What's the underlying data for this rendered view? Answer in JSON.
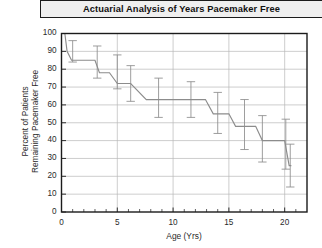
{
  "title": "Actuarial Analysis of Years Pacemaker Free",
  "axes": {
    "ylabel_line1": "Percent of Patients",
    "ylabel_line2": "Remaining Pacemaker Free",
    "xlabel": "Age (Yrs)"
  },
  "colors": {
    "curve": "#8c8c8c",
    "errorbar": "#8c8c8c",
    "grid": "#b8b8b8",
    "axis": "#1b1b1b",
    "title_fill": "#efefef",
    "plot_fill": "#ffffff"
  },
  "chart_data": {
    "type": "line",
    "title": "Actuarial Analysis of Years Pacemaker Free",
    "xlabel": "Age (Yrs)",
    "ylabel": "Percent of Patients Remaining Pacemaker Free",
    "xlim": [
      0,
      22
    ],
    "ylim": [
      0,
      100
    ],
    "xticks": [
      0,
      5,
      10,
      15,
      20
    ],
    "yticks": [
      0,
      10,
      20,
      30,
      40,
      50,
      60,
      70,
      80,
      90,
      100
    ],
    "xtick_labels": [
      "0",
      "5",
      "10",
      "15",
      "20"
    ],
    "ytick_labels": [
      "0",
      "10",
      "20",
      "30",
      "40",
      "50",
      "60",
      "70",
      "80",
      "90",
      "100"
    ],
    "grid": "horizontal-and-vertical",
    "legend": "none",
    "style": "kaplan-meier-step-survival",
    "series": [
      {
        "name": "Pacemaker-free survival",
        "step_points": [
          {
            "x": 0.0,
            "y": 100
          },
          {
            "x": 0.3,
            "y": 100
          },
          {
            "x": 0.5,
            "y": 90
          },
          {
            "x": 0.9,
            "y": 85
          },
          {
            "x": 1.0,
            "y": 85
          },
          {
            "x": 3.0,
            "y": 85
          },
          {
            "x": 3.4,
            "y": 78
          },
          {
            "x": 4.3,
            "y": 78
          },
          {
            "x": 5.0,
            "y": 72
          },
          {
            "x": 6.2,
            "y": 72
          },
          {
            "x": 7.6,
            "y": 63
          },
          {
            "x": 9.0,
            "y": 63
          },
          {
            "x": 12.9,
            "y": 63
          },
          {
            "x": 13.6,
            "y": 55
          },
          {
            "x": 15.0,
            "y": 55
          },
          {
            "x": 15.6,
            "y": 48
          },
          {
            "x": 17.4,
            "y": 48
          },
          {
            "x": 18.0,
            "y": 40
          },
          {
            "x": 20.0,
            "y": 40
          },
          {
            "x": 20.4,
            "y": 26
          },
          {
            "x": 20.6,
            "y": 26
          }
        ],
        "error_bars": [
          {
            "x": 1.0,
            "y": 90,
            "low": 84,
            "high": 96
          },
          {
            "x": 3.2,
            "y": 85,
            "low": 75,
            "high": 93
          },
          {
            "x": 5.0,
            "y": 78,
            "low": 69,
            "high": 88
          },
          {
            "x": 6.2,
            "y": 72,
            "low": 62,
            "high": 82
          },
          {
            "x": 8.7,
            "y": 63,
            "low": 53,
            "high": 75
          },
          {
            "x": 11.6,
            "y": 63,
            "low": 53,
            "high": 73
          },
          {
            "x": 14.0,
            "y": 55,
            "low": 44,
            "high": 67
          },
          {
            "x": 16.4,
            "y": 48,
            "low": 35,
            "high": 63
          },
          {
            "x": 18.0,
            "y": 40,
            "low": 28,
            "high": 54
          },
          {
            "x": 20.1,
            "y": 38,
            "low": 24,
            "high": 52
          },
          {
            "x": 20.5,
            "y": 26,
            "low": 14,
            "high": 38
          }
        ]
      }
    ]
  }
}
